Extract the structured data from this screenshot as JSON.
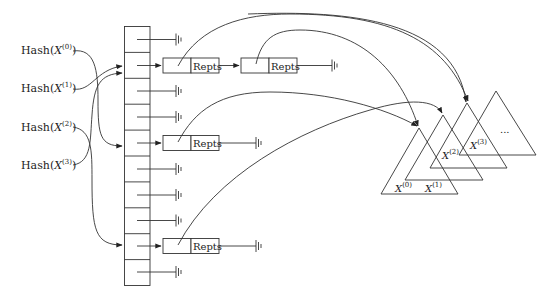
{
  "diagram": {
    "type": "hash-table-to-trees",
    "hash_inputs": [
      {
        "label": "Hash(",
        "var": "X",
        "sup": "(0)",
        "close": ")",
        "target_row": 5
      },
      {
        "label": "Hash(",
        "var": "X",
        "sup": "(1)",
        "close": ")",
        "target_row": 2
      },
      {
        "label": "Hash(",
        "var": "X",
        "sup": "(2)",
        "close": ")",
        "target_row": 9
      },
      {
        "label": "Hash(",
        "var": "X",
        "sup": "(3)",
        "close": ")",
        "target_row": 2
      }
    ],
    "table": {
      "row_count": 10,
      "rows": [
        {
          "index": 1,
          "content": "null"
        },
        {
          "index": 2,
          "content": "chain",
          "chain": [
            "Repts",
            "Repts"
          ]
        },
        {
          "index": 3,
          "content": "null"
        },
        {
          "index": 4,
          "content": "null"
        },
        {
          "index": 5,
          "content": "chain",
          "chain": [
            "Repts"
          ]
        },
        {
          "index": 6,
          "content": "null"
        },
        {
          "index": 7,
          "content": "null"
        },
        {
          "index": 8,
          "content": "null"
        },
        {
          "index": 9,
          "content": "chain",
          "chain": [
            "Repts"
          ]
        },
        {
          "index": 10,
          "content": "null"
        }
      ]
    },
    "node_label": "Repts",
    "trees": [
      {
        "var": "X",
        "sup": "(0)"
      },
      {
        "var": "X",
        "sup": "(1)"
      },
      {
        "var": "X",
        "sup": "(2)"
      },
      {
        "var": "X",
        "sup": "(3)"
      }
    ],
    "more_trees": "...",
    "colors": {
      "line": "#333333",
      "background": "#ffffff",
      "text": "#222222"
    }
  }
}
